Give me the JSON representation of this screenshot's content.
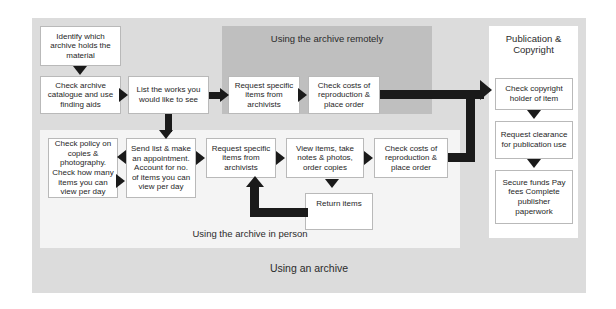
{
  "diagram": {
    "outer_label": "Using an archive",
    "panels": {
      "remote_label": "Using the archive remotely",
      "inperson_label": "Using the archive in person",
      "publication_title": "Publication & Copyright"
    },
    "boxes": {
      "identify": "Identify which archive holds the material",
      "check_archive": "Check archive catalogue and use finding aids",
      "list_works": "List the works you would like to see",
      "request_remote": "Request specific items from archivists",
      "costs_remote": "Check costs of reproduction & place order",
      "check_policy": "Check policy on copies & photography. Check how many items you can view per day",
      "send_list": "Send list & make an appointment. Account for no. of items you can view per day",
      "request_person": "Request specific items from archivists",
      "view_items": "View items, take notes & photos, order copies",
      "costs_person": "Check costs of reproduction & place order",
      "return_items": "Return items",
      "copyright_holder": "Check copyright holder of item",
      "clearance": "Request clearance for publication use",
      "secure_funds": "Secure funds Pay fees Complete publisher paperwork"
    },
    "colors": {
      "outer_frame": "#dcdcdc",
      "remote_panel": "#bfbfbf",
      "inperson_panel": "#f4f4f4",
      "publication_panel": "#ffffff",
      "box_fill": "#ffffff",
      "box_border": "#b9b9b9",
      "arrow": "#1a1a1a",
      "text": "#262626"
    }
  }
}
